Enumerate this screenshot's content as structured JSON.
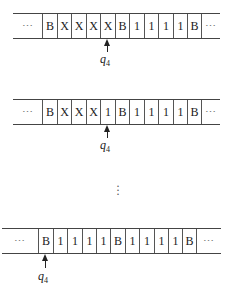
{
  "diagram": {
    "title": "",
    "tapes": [
      {
        "left_ellipsis": "⋯",
        "cells": [
          "B",
          "X",
          "X",
          "X",
          "X",
          "B",
          "1",
          "1",
          "1",
          "1",
          "B"
        ],
        "right_ellipsis": "⋯",
        "head_position": 4,
        "state": "q",
        "state_sub": "4"
      },
      {
        "left_ellipsis": "⋯",
        "cells": [
          "B",
          "X",
          "X",
          "X",
          "1",
          "B",
          "1",
          "1",
          "1",
          "1",
          "B"
        ],
        "right_ellipsis": "⋯",
        "head_position": 4,
        "state": "q",
        "state_sub": "4"
      },
      {
        "left_ellipsis": "⋯",
        "cells": [
          "B",
          "1",
          "1",
          "1",
          "1",
          "B",
          "1",
          "1",
          "1",
          "1",
          "B"
        ],
        "right_ellipsis": "⋯",
        "head_position": 0,
        "state": "q",
        "state_sub": "4"
      }
    ],
    "vertical_ellipsis": "⋮",
    "colors": {
      "line": "#444444",
      "text": "#222222",
      "background": "#ffffff"
    }
  }
}
